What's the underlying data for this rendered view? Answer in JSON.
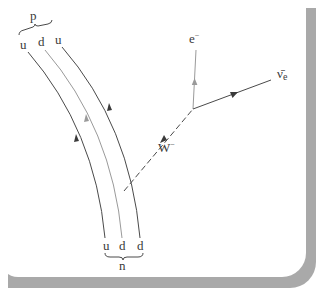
{
  "diagram": {
    "proton": {
      "label": "p",
      "quarks": [
        "u",
        "d",
        "u"
      ]
    },
    "neutron": {
      "label": "n",
      "quarks": [
        "u",
        "d",
        "d"
      ]
    },
    "boson": {
      "label": "W",
      "charge": "−"
    },
    "electron": {
      "label": "e",
      "charge": "−"
    },
    "antineutrino": {
      "label": "ν̄",
      "subscript": "e"
    },
    "colors": {
      "dark_line": "#4a4a4a",
      "light_line": "#9a9a9a",
      "shadow": "#a9a9a9",
      "background": "#ffffff"
    }
  }
}
